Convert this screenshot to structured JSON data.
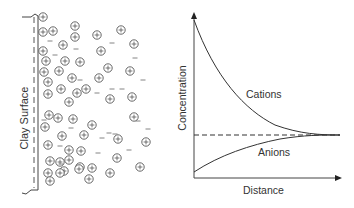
{
  "left_panel": {
    "surface_label": "Clay Surface",
    "cation_symbol": "+",
    "anion_symbol": "–",
    "cations": [
      [
        43,
        17
      ],
      [
        43,
        32
      ],
      [
        53,
        31
      ],
      [
        75,
        26
      ],
      [
        97,
        35
      ],
      [
        121,
        30
      ],
      [
        75,
        37
      ],
      [
        134,
        44
      ],
      [
        63,
        45
      ],
      [
        43,
        51
      ],
      [
        101,
        51
      ],
      [
        46,
        61
      ],
      [
        65,
        61
      ],
      [
        80,
        62
      ],
      [
        108,
        68
      ],
      [
        44,
        72
      ],
      [
        59,
        71
      ],
      [
        72,
        78
      ],
      [
        130,
        71
      ],
      [
        99,
        78
      ],
      [
        48,
        82
      ],
      [
        61,
        89
      ],
      [
        77,
        93
      ],
      [
        86,
        89
      ],
      [
        48,
        94
      ],
      [
        69,
        102
      ],
      [
        110,
        99
      ],
      [
        132,
        97
      ],
      [
        49,
        115
      ],
      [
        58,
        118
      ],
      [
        73,
        119
      ],
      [
        134,
        117
      ],
      [
        92,
        125
      ],
      [
        45,
        127
      ],
      [
        62,
        136
      ],
      [
        84,
        135
      ],
      [
        118,
        139
      ],
      [
        48,
        145
      ],
      [
        146,
        142
      ],
      [
        81,
        151
      ],
      [
        69,
        150
      ],
      [
        117,
        158
      ],
      [
        60,
        162
      ],
      [
        69,
        160
      ],
      [
        50,
        161
      ],
      [
        64,
        171
      ],
      [
        80,
        167
      ],
      [
        92,
        168
      ],
      [
        140,
        167
      ],
      [
        48,
        173
      ],
      [
        60,
        173
      ],
      [
        79,
        169
      ],
      [
        89,
        179
      ],
      [
        110,
        173
      ],
      [
        50,
        181
      ]
    ],
    "anions": [
      [
        50,
        41
      ],
      [
        55,
        55
      ],
      [
        76,
        49
      ],
      [
        112,
        43
      ],
      [
        135,
        58
      ],
      [
        143,
        80
      ],
      [
        80,
        80
      ],
      [
        97,
        93
      ],
      [
        112,
        89
      ],
      [
        122,
        89
      ],
      [
        44,
        120
      ],
      [
        71,
        128
      ],
      [
        138,
        121
      ],
      [
        115,
        134
      ],
      [
        60,
        146
      ],
      [
        102,
        138
      ],
      [
        129,
        150
      ],
      [
        61,
        164
      ],
      [
        148,
        129
      ],
      [
        98,
        153
      ],
      [
        109,
        133
      ]
    ]
  },
  "chart_data": {
    "type": "line",
    "title": "",
    "xlabel": "Distance",
    "ylabel": "Concentration",
    "grid": false,
    "legend": "inline labels",
    "x": [
      0,
      0.1,
      0.2,
      0.3,
      0.4,
      0.5,
      0.6,
      0.7,
      0.8,
      0.9,
      1.0
    ],
    "series": [
      {
        "name": "Cations",
        "values": [
          1.0,
          0.74,
          0.55,
          0.41,
          0.3,
          0.22,
          0.15,
          0.09,
          0.05,
          0.02,
          0.0
        ],
        "style": "solid"
      },
      {
        "name": "Anions",
        "values": [
          -0.21,
          -0.15,
          -0.11,
          -0.08,
          -0.06,
          -0.04,
          -0.03,
          -0.02,
          -0.01,
          0.0,
          0.0
        ],
        "style": "solid"
      },
      {
        "name": "Bulk concentration",
        "values": [
          0,
          0,
          0,
          0,
          0,
          0,
          0,
          0,
          0,
          0,
          0
        ],
        "style": "dashed"
      }
    ],
    "annotations": [
      "Cations",
      "Anions"
    ]
  },
  "chart": {
    "cations_label": "Cations",
    "anions_label": "Anions",
    "xlabel": "Distance",
    "ylabel": "Concentration"
  }
}
